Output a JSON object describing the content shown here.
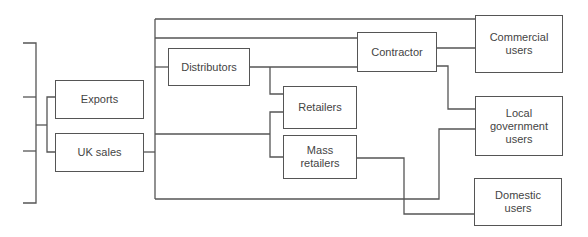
{
  "diagram": {
    "type": "flow-chart",
    "nodes": [
      {
        "id": "exports",
        "label": "Exports"
      },
      {
        "id": "uk_sales",
        "label": "UK sales"
      },
      {
        "id": "distributors",
        "label": "Distributors"
      },
      {
        "id": "contractor",
        "label": "Contractor"
      },
      {
        "id": "retailers",
        "label": "Retailers"
      },
      {
        "id": "mass_retailers",
        "label": "Mass retailers"
      },
      {
        "id": "commercial_users",
        "label": "Commercial users"
      },
      {
        "id": "local_government_users",
        "label": "Local government users"
      },
      {
        "id": "domestic_users",
        "label": "Domestic users"
      }
    ],
    "labels": {
      "exports": "Exports",
      "uk_sales": "UK sales",
      "distributors": "Distributors",
      "contractor": "Contractor",
      "retailers": "Retailers",
      "mass_retailers_1": "Mass",
      "mass_retailers_2": "retailers",
      "commercial_1": "Commercial",
      "commercial_2": "users",
      "local_1": "Local",
      "local_2": "government",
      "local_3": "users",
      "domestic_1": "Domestic",
      "domestic_2": "users"
    },
    "line_color": "#555555"
  }
}
